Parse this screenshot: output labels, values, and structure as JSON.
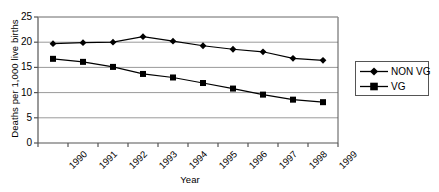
{
  "chart_data": {
    "type": "line",
    "title": "",
    "xlabel": "Year",
    "ylabel": "Deaths per 1,000 live births",
    "categories": [
      "1990",
      "1991",
      "1992",
      "1993",
      "1994",
      "1995",
      "1996",
      "1997",
      "1998",
      "1999"
    ],
    "series": [
      {
        "name": "NON VG",
        "marker": "diamond",
        "color": "#000000",
        "values": [
          19.7,
          19.9,
          20.0,
          21.1,
          20.2,
          19.3,
          18.6,
          18.1,
          16.8,
          16.4
        ]
      },
      {
        "name": "VG",
        "marker": "square",
        "color": "#000000",
        "values": [
          16.7,
          16.1,
          15.1,
          13.7,
          13.0,
          11.9,
          10.8,
          9.6,
          8.6,
          8.1
        ]
      }
    ],
    "ylim": [
      0,
      25
    ],
    "yticks": [
      0,
      5,
      10,
      15,
      20,
      25
    ],
    "ytick_labels": [
      "0",
      "5",
      "10",
      "15",
      "20",
      "25"
    ],
    "grid": "horizontal",
    "grid_color": "#9a9a9a",
    "axis_color": "#555555",
    "legend_position": "right"
  },
  "legend": {
    "entries": [
      {
        "label": "NON VG"
      },
      {
        "label": "VG"
      }
    ]
  }
}
